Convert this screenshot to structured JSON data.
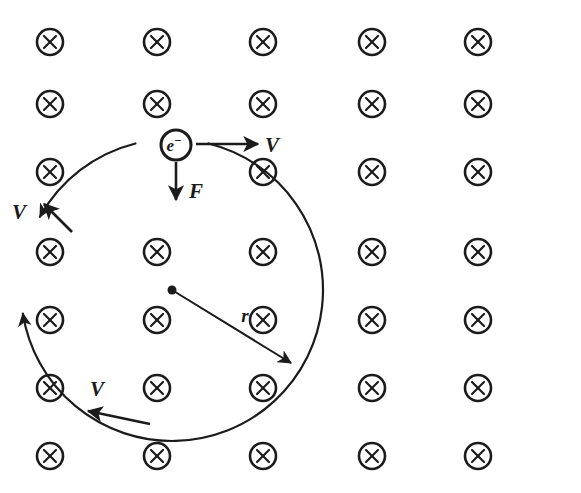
{
  "diagram": {
    "background_color": "#ffffff",
    "ink_color": "#1b1b1b",
    "width": 581,
    "height": 493
  },
  "field": {
    "symbol_name": "magnetic-field-into-page-x",
    "symbol_glyph": "x",
    "description": "Circled X symbols representing a uniform magnetic field directed into the page",
    "columns": 5,
    "rows": 7,
    "column_x": [
      50,
      157,
      263,
      372,
      478
    ],
    "row_y": [
      42,
      104,
      172,
      252,
      320,
      388,
      456
    ],
    "circle_radius": 13,
    "cross_half": 6,
    "omitted_cell": {
      "column_index": 1,
      "row_index": 2,
      "reason": "occupied by electron"
    }
  },
  "particle": {
    "name": "electron",
    "label_base": "e",
    "label_superscript": "−",
    "label_full": "e−",
    "center_x": 176,
    "center_y": 145,
    "radius": 15
  },
  "orbit": {
    "name": "circular-trajectory",
    "center_x": 172,
    "center_y": 290,
    "radius": 151,
    "stroke_width": 2.2
  },
  "radius_indicator": {
    "label": "r",
    "label_x": 245,
    "label_y": 322,
    "from_x": 172,
    "from_y": 290,
    "to_x": 291,
    "to_y": 363,
    "center_dot_radius": 4.5
  },
  "vectors": [
    {
      "name": "velocity-vector-top",
      "label": "V",
      "label_x": 272,
      "label_y": 152,
      "from_x": 196,
      "from_y": 144,
      "to_x": 258,
      "to_y": 144,
      "direction": "right"
    },
    {
      "name": "force-vector",
      "label": "F",
      "label_x": 196,
      "label_y": 198,
      "from_x": 176,
      "from_y": 162,
      "to_x": 176,
      "to_y": 200,
      "direction": "down"
    },
    {
      "name": "velocity-vector-left",
      "label": "V",
      "label_x": 19,
      "label_y": 219,
      "from_x": 72,
      "from_y": 232,
      "to_x": 44,
      "to_y": 204,
      "direction": "up-left"
    },
    {
      "name": "velocity-vector-bottom",
      "label": "V",
      "label_x": 97,
      "label_y": 396,
      "from_x": 150,
      "from_y": 424,
      "to_x": 88,
      "to_y": 411,
      "direction": "left"
    }
  ]
}
